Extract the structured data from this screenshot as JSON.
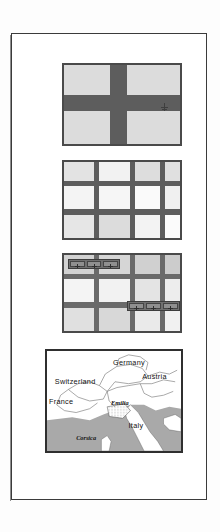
{
  "document": {
    "background_color": "#fdfdfd",
    "page_border_color": "#3b3b3b",
    "figure_count": 4
  },
  "figures": [
    {
      "id": "figure-1",
      "caption": "",
      "type": "cross-grid-diagram",
      "fill_color": "#dcdcdc",
      "line_color": "#5d5d5d",
      "marker_label": "",
      "columns": 3,
      "rows": 3
    },
    {
      "id": "figure-2",
      "caption": "",
      "type": "shaded-grid-diagram",
      "fill_color": "#e8e8e8",
      "line_color": "#5d5d5d",
      "columns": 4,
      "rows": 3
    },
    {
      "id": "figure-3",
      "caption": "",
      "type": "grid-with-toolbars",
      "fill_color": "#e8e8e8",
      "line_color": "#6a6a6a",
      "columns": 4,
      "rows": 3,
      "toolbars": [
        {
          "id": "toolbar-top-left",
          "cells": 3,
          "cell_icon": "plus-marker-icon"
        },
        {
          "id": "toolbar-mid-right",
          "cells": 3,
          "cell_icon": "plus-marker-icon"
        }
      ]
    },
    {
      "id": "figure-4",
      "caption": "",
      "type": "map",
      "land_color": "#ffffff",
      "sea_color": "#a9a9a9",
      "border_color": "#2f2f2f"
    }
  ],
  "map": {
    "title": "",
    "countries": [
      {
        "name": "Germany",
        "x": 68,
        "y": 15,
        "style": "upright"
      },
      {
        "name": "Austria",
        "x": 98,
        "y": 29,
        "style": "upright"
      },
      {
        "name": "Switzerland",
        "x": 8,
        "y": 34,
        "style": "upright"
      },
      {
        "name": "France",
        "x": 2,
        "y": 55,
        "style": "upright"
      },
      {
        "name": "Italy",
        "x": 84,
        "y": 80,
        "style": "upright"
      }
    ],
    "regions": [
      {
        "name": "Emilia",
        "x": 66,
        "y": 56,
        "style": "italic"
      },
      {
        "name": "Corsica",
        "x": 30,
        "y": 93,
        "style": "italic"
      }
    ]
  }
}
